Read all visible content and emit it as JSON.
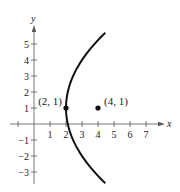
{
  "chart_data": {
    "type": "line",
    "title": "",
    "xlabel": "x",
    "ylabel": "y",
    "xlim": [
      -1.5,
      8.2
    ],
    "ylim": [
      -3.7,
      6
    ],
    "grid": false,
    "x_ticks": [
      1,
      2,
      3,
      4,
      5,
      6,
      7
    ],
    "y_ticks": [
      -3,
      -2,
      -1,
      1,
      2,
      3,
      4,
      5
    ],
    "x_tick_labels": [
      "1",
      "2",
      "3",
      "4",
      "5",
      "6",
      "7"
    ],
    "y_tick_labels": [
      "−3",
      "−2",
      "−1",
      "1",
      "2",
      "3",
      "4",
      "5"
    ],
    "series": [
      {
        "name": "parabola",
        "equation": "(y - 1)^2 = 8(x - 2)",
        "vertex": [
          2,
          1
        ],
        "opens": "right",
        "y_range": [
          -3.7,
          5.7
        ],
        "color": "#111111"
      }
    ],
    "points": [
      {
        "x": 2,
        "y": 1,
        "label": "(2, 1)",
        "role": "vertex"
      },
      {
        "x": 4,
        "y": 1,
        "label": "(4, 1)",
        "role": "focus"
      }
    ]
  },
  "colors": {
    "axis": "#555555",
    "curve": "#111111",
    "point": "#111111",
    "text": "#222222"
  }
}
